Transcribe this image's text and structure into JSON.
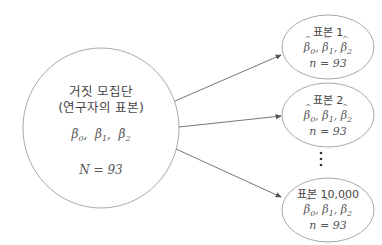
{
  "population": {
    "title_line1": "거짓 모집단",
    "title_line2": "(연구자의 표본)",
    "params": [
      "β",
      "β",
      "β"
    ],
    "param_subs": [
      "0",
      "1",
      "2"
    ],
    "size_label": "N = 93"
  },
  "samples": [
    {
      "title": "표본 1",
      "estimates": [
        "β",
        "β",
        "β"
      ],
      "subs": [
        "0",
        "1",
        "2"
      ],
      "size_label": "n = 93"
    },
    {
      "title": "표본 2",
      "estimates": [
        "β",
        "β",
        "β"
      ],
      "subs": [
        "0",
        "1",
        "2"
      ],
      "size_label": "n = 93"
    },
    {
      "title": "표본 10,000",
      "estimates": [
        "β",
        "β",
        "β"
      ],
      "subs": [
        "0",
        "1",
        "2"
      ],
      "size_label": "n = 93"
    }
  ],
  "ellipsis": "⋮",
  "colors": {
    "stroke": "#9a9a9a",
    "arrow": "#555555",
    "text": "#444444"
  }
}
